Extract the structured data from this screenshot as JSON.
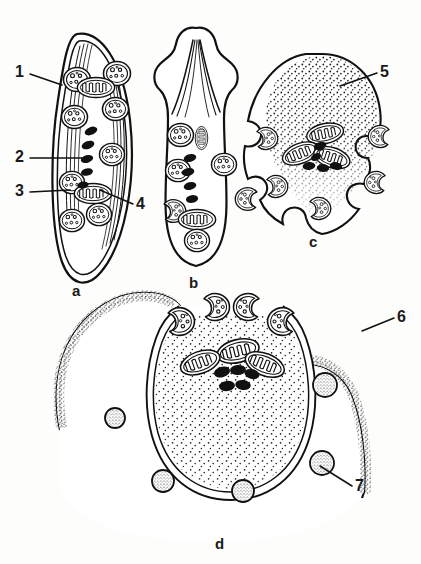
{
  "figure": {
    "type": "scientific-line-diagram",
    "background_color": "#fdfdfb",
    "ink_color": "#111111",
    "panels": [
      {
        "id": "a",
        "letter": "a",
        "x": 74,
        "y": 286,
        "description": "elongate spindle-shaped cell with longitudinal striations, mitochondria, vacuolated nuclei and five dark rod bodies"
      },
      {
        "id": "b",
        "letter": "b",
        "x": 191,
        "y": 278,
        "description": "club-shaped cell with apical projections and internal fibre strands"
      },
      {
        "id": "c",
        "letter": "c",
        "x": 311,
        "y": 237,
        "description": "ovoid cell with stippled apical cytoplasm and peripheral notched nuclei"
      },
      {
        "id": "d",
        "letter": "d",
        "x": 217,
        "y": 539,
        "description": "large cup-shaped cell with dense stippled cytoplasm, inner membrane, dark rods and stippled granules"
      }
    ],
    "callouts": [
      {
        "id": "1",
        "label": "1",
        "x": 16,
        "y": 66,
        "leader": {
          "x1": 30,
          "y1": 74,
          "x2": 62,
          "y2": 85
        },
        "target": "pellicle / outer cell membrane of panel a"
      },
      {
        "id": "2",
        "label": "2",
        "x": 16,
        "y": 150,
        "leader": {
          "x1": 30,
          "y1": 158,
          "x2": 88,
          "y2": 158
        },
        "target": "dark rod-shaped bodies of panel a"
      },
      {
        "id": "3",
        "label": "3",
        "x": 16,
        "y": 184,
        "leader": {
          "x1": 30,
          "y1": 192,
          "x2": 69,
          "y2": 190
        },
        "target": "vacuolated nucleus of panel a"
      },
      {
        "id": "4",
        "label": "4",
        "x": 134,
        "y": 196,
        "leader": {
          "x1": 133,
          "y1": 204,
          "x2": 101,
          "y2": 190
        },
        "target": "mitochondrion with cristae of panel a"
      },
      {
        "id": "5",
        "label": "5",
        "x": 379,
        "y": 65,
        "leader": {
          "x1": 377,
          "y1": 73,
          "x2": 340,
          "y2": 86
        },
        "target": "stippled apical cytoplasm of panel c"
      },
      {
        "id": "6",
        "label": "6",
        "x": 396,
        "y": 310,
        "leader": {
          "x1": 394,
          "y1": 318,
          "x2": 364,
          "y2": 330
        },
        "target": "cell surface / outer boundary of panel d"
      },
      {
        "id": "7",
        "label": "7",
        "x": 354,
        "y": 478,
        "leader": {
          "x1": 352,
          "y1": 486,
          "x2": 322,
          "y2": 466
        },
        "target": "stippled cytoplasmic granule of panel d"
      }
    ],
    "legend_keys": {
      "mitochondrion": "elongate body with zig-zag internal cristae",
      "nucleus": "rounded body with small internal granules",
      "rod_body": "solid black elongate rod",
      "granule": "circle filled with fine stipple",
      "stipple": "fine dotted cytoplasmic texture"
    },
    "counts": {
      "rods_panel_a": 5,
      "rods_panel_b": 5,
      "rods_panel_c": 5,
      "rods_panel_d": 5,
      "granules_panel_d": 5,
      "mitochondria_panel_d": 3,
      "notched_nuclei_panel_c": 5,
      "notched_nuclei_panel_d": 5
    }
  }
}
